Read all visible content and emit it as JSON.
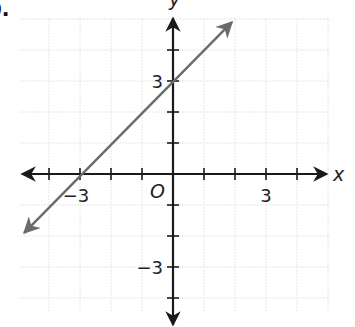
{
  "problem": {
    "label": "b."
  },
  "colors": {
    "axis": "#1a1a1a",
    "grid": "#e6e6e6",
    "line": "#6b6b6b",
    "text": "#222222"
  },
  "chart_data": {
    "type": "line",
    "title": "",
    "xlabel": "x",
    "ylabel": "y",
    "origin_label": "O",
    "xlim": [
      -5,
      5
    ],
    "ylim": [
      -5,
      5
    ],
    "grid": true,
    "x_tick_labels": [
      {
        "value": -3,
        "text": "−3"
      },
      {
        "value": 3,
        "text": "3"
      }
    ],
    "y_tick_labels": [
      {
        "value": 3,
        "text": "3"
      },
      {
        "value": -3,
        "text": "−3"
      }
    ],
    "series": [
      {
        "name": "y = x + 3",
        "equation": "y = x + 3",
        "slope": 1,
        "intercept": 3,
        "x_intercept": -3,
        "points": [
          [
            -4.8,
            -1.9
          ],
          [
            -3,
            0
          ],
          [
            0,
            3
          ],
          [
            1.9,
            4.9
          ]
        ],
        "arrows_both_ends": true
      }
    ]
  }
}
